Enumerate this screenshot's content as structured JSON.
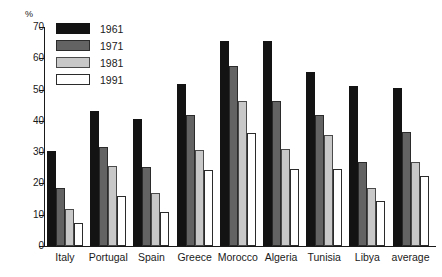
{
  "chart_data": {
    "type": "bar",
    "title": "",
    "xlabel": "",
    "ylabel": "%",
    "ylim": [
      0,
      70
    ],
    "yticks": [
      0,
      10,
      20,
      30,
      40,
      50,
      60,
      70
    ],
    "grid": false,
    "legend_position": "top-left",
    "categories": [
      "Italy",
      "Portugal",
      "Spain",
      "Greece",
      "Morocco",
      "Algeria",
      "Tunisia",
      "Libya",
      "average"
    ],
    "series": [
      {
        "name": "1961",
        "color": "#131313",
        "values": [
          30.3,
          43.0,
          40.7,
          51.8,
          65.5,
          65.5,
          55.7,
          51.0,
          50.5
        ]
      },
      {
        "name": "1971",
        "color": "#636363",
        "values": [
          18.5,
          31.5,
          25.3,
          42.0,
          57.5,
          46.5,
          42.0,
          27.0,
          36.5
        ]
      },
      {
        "name": "1981",
        "color": "#c8c8c8",
        "values": [
          11.7,
          25.5,
          17.0,
          30.7,
          46.5,
          31.0,
          35.5,
          18.5,
          27.0
        ]
      },
      {
        "name": "1991",
        "color": "#ffffff",
        "values": [
          7.3,
          16.0,
          11.0,
          24.3,
          36.0,
          24.5,
          24.5,
          14.5,
          22.5
        ]
      }
    ]
  }
}
